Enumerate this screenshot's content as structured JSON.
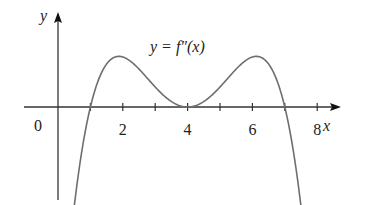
{
  "chart_data": {
    "type": "line",
    "title": "y = f″(x)",
    "curve_label": "y = f″(x)",
    "xlabel": "x",
    "ylabel": "y",
    "origin_label": "0",
    "x_tick_labels": [
      "2",
      "4",
      "6",
      "8"
    ],
    "x_ticks": [
      1,
      2,
      3,
      4,
      5,
      6,
      7,
      8
    ],
    "xlim": [
      -1.2,
      9
    ],
    "grid": false,
    "legend": "none",
    "series": [
      {
        "name": "f''(x)",
        "formula_shape": "-(x-1)(x-4)^2(x-7)",
        "x": [
          0.47,
          1,
          1.5,
          2,
          2.5,
          3,
          3.5,
          4,
          4.5,
          5,
          5.5,
          6,
          6.5,
          7,
          7.53
        ],
        "y": [
          -1.8,
          0,
          0.7,
          1.0,
          0.8,
          0.4,
          0.1,
          0,
          0.1,
          0.4,
          0.8,
          1.0,
          0.7,
          0,
          -1.8
        ]
      }
    ],
    "features": {
      "zeros": [
        1,
        4,
        7
      ],
      "local_maxima": [
        [
          2,
          1.0
        ],
        [
          6,
          1.0
        ]
      ],
      "touches_axis_at": 4
    }
  },
  "colors": {
    "axis": "#333333",
    "curve": "#6e6e6e",
    "text": "#222222"
  }
}
